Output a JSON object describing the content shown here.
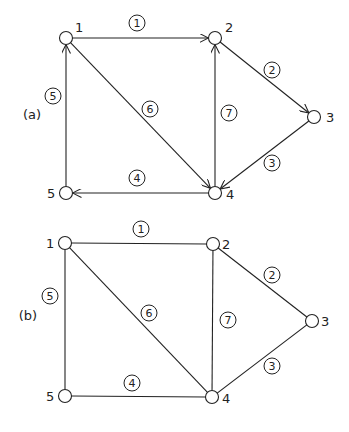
{
  "figures": [
    {
      "label": "(a)",
      "label_pos": [
        32,
        119
      ],
      "directed": true,
      "nodes": [
        {
          "id": "1",
          "x": 66,
          "y": 38,
          "lx": 75,
          "ly": 32
        },
        {
          "id": "2",
          "x": 215,
          "y": 38,
          "lx": 225,
          "ly": 32
        },
        {
          "id": "3",
          "x": 314,
          "y": 117,
          "lx": 326,
          "ly": 122
        },
        {
          "id": "4",
          "x": 215,
          "y": 193,
          "lx": 226,
          "ly": 199
        },
        {
          "id": "5",
          "x": 66,
          "y": 193,
          "lx": 47,
          "ly": 198
        }
      ],
      "edges": [
        {
          "id": "1",
          "from": "1",
          "to": "2",
          "lx": 137,
          "ly": 23
        },
        {
          "id": "2",
          "from": "2",
          "to": "3",
          "lx": 272,
          "ly": 70
        },
        {
          "id": "3",
          "from": "3",
          "to": "4",
          "lx": 272,
          "ly": 163
        },
        {
          "id": "4",
          "from": "4",
          "to": "5",
          "lx": 137,
          "ly": 178
        },
        {
          "id": "5",
          "from": "5",
          "to": "1",
          "lx": 53,
          "ly": 96
        },
        {
          "id": "6",
          "from": "1",
          "to": "4",
          "lx": 150,
          "ly": 109
        },
        {
          "id": "7",
          "from": "4",
          "to": "2",
          "lx": 229,
          "ly": 113
        }
      ]
    },
    {
      "label": "(b)",
      "label_pos": [
        28,
        320
      ],
      "directed": false,
      "nodes": [
        {
          "id": "1",
          "x": 65,
          "y": 243,
          "lx": 46,
          "ly": 248
        },
        {
          "id": "2",
          "x": 213,
          "y": 244,
          "lx": 222,
          "ly": 249
        },
        {
          "id": "3",
          "x": 312,
          "y": 321,
          "lx": 321,
          "ly": 326
        },
        {
          "id": "4",
          "x": 212,
          "y": 397,
          "lx": 222,
          "ly": 403
        },
        {
          "id": "5",
          "x": 65,
          "y": 396,
          "lx": 46,
          "ly": 401
        }
      ],
      "edges": [
        {
          "id": "1",
          "from": "1",
          "to": "2",
          "lx": 141,
          "ly": 229
        },
        {
          "id": "2",
          "from": "2",
          "to": "3",
          "lx": 272,
          "ly": 275
        },
        {
          "id": "3",
          "from": "3",
          "to": "4",
          "lx": 272,
          "ly": 366
        },
        {
          "id": "4",
          "from": "5",
          "to": "4",
          "lx": 132,
          "ly": 383
        },
        {
          "id": "5",
          "from": "1",
          "to": "5",
          "lx": 50,
          "ly": 296
        },
        {
          "id": "6",
          "from": "1",
          "to": "4",
          "lx": 149,
          "ly": 313
        },
        {
          "id": "7",
          "from": "4",
          "to": "2",
          "lx": 228,
          "ly": 320
        }
      ]
    }
  ]
}
